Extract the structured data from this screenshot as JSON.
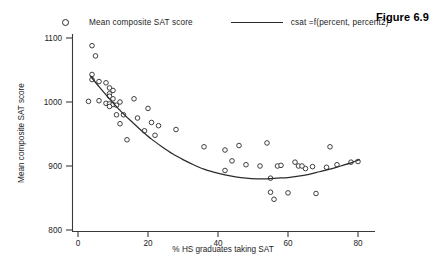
{
  "figure": {
    "caption": "Figure 6.9"
  },
  "legend": {
    "position": "top",
    "entries": [
      {
        "label": "Mean composite SAT score",
        "symbol": "open-circle-marker"
      },
      {
        "label": "csat =f(percent, percent2)",
        "symbol": "solid-line"
      }
    ]
  },
  "chart_data": {
    "type": "scatter",
    "title": "",
    "xlabel": "% HS graduates taking SAT",
    "ylabel": "Mean composite SAT score",
    "xlim": [
      0,
      85
    ],
    "ylim": [
      790,
      1130
    ],
    "xticks": [
      0,
      20,
      40,
      60,
      80
    ],
    "yticks": [
      800,
      900,
      1000,
      1100
    ],
    "grid": false,
    "legend_position": "top",
    "series": [
      {
        "name": "Mean composite SAT score",
        "type": "scatter",
        "marker": "open-circle",
        "points": [
          [
            4,
            1088
          ],
          [
            5,
            1072
          ],
          [
            4,
            1043
          ],
          [
            4,
            1035
          ],
          [
            6,
            1032
          ],
          [
            8,
            1030
          ],
          [
            9,
            1022
          ],
          [
            10,
            1018
          ],
          [
            9,
            1013
          ],
          [
            9,
            1009
          ],
          [
            10,
            1005
          ],
          [
            3,
            1001
          ],
          [
            6,
            1002
          ],
          [
            8,
            998
          ],
          [
            9,
            997
          ],
          [
            10,
            996
          ],
          [
            11,
            995
          ],
          [
            9,
            993
          ],
          [
            12,
            1000
          ],
          [
            16,
            1005
          ],
          [
            11,
            980
          ],
          [
            13,
            980
          ],
          [
            20,
            990
          ],
          [
            12,
            966
          ],
          [
            17,
            975
          ],
          [
            21,
            968
          ],
          [
            23,
            963
          ],
          [
            14,
            941
          ],
          [
            19,
            955
          ],
          [
            28,
            957
          ],
          [
            22,
            948
          ],
          [
            36,
            930
          ],
          [
            42,
            925
          ],
          [
            46,
            932
          ],
          [
            54,
            936
          ],
          [
            44,
            908
          ],
          [
            48,
            902
          ],
          [
            52,
            900
          ],
          [
            42,
            893
          ],
          [
            57,
            900
          ],
          [
            58,
            901
          ],
          [
            62,
            906
          ],
          [
            65,
            896
          ],
          [
            67,
            899
          ],
          [
            63,
            900
          ],
          [
            64,
            900
          ],
          [
            72,
            930
          ],
          [
            71,
            898
          ],
          [
            74,
            902
          ],
          [
            78,
            906
          ],
          [
            80,
            907
          ],
          [
            55,
            881
          ],
          [
            55,
            859
          ],
          [
            56,
            848
          ],
          [
            60,
            858
          ],
          [
            68,
            857
          ]
        ]
      },
      {
        "name": "csat =f(percent, percent2)",
        "type": "line",
        "fit": "quadratic",
        "points": [
          [
            3.5,
            1041
          ],
          [
            6,
            1024
          ],
          [
            9,
            1005
          ],
          [
            12,
            987
          ],
          [
            15,
            971
          ],
          [
            18,
            956
          ],
          [
            21,
            942
          ],
          [
            24,
            930
          ],
          [
            27,
            919
          ],
          [
            30,
            910
          ],
          [
            33,
            902
          ],
          [
            36,
            895
          ],
          [
            39,
            890
          ],
          [
            42,
            886
          ],
          [
            45,
            883
          ],
          [
            48,
            881
          ],
          [
            51,
            880
          ],
          [
            54,
            880
          ],
          [
            57,
            881
          ],
          [
            60,
            882
          ],
          [
            63,
            884
          ],
          [
            66,
            887
          ],
          [
            69,
            891
          ],
          [
            72,
            895
          ],
          [
            75,
            900
          ],
          [
            78,
            905
          ],
          [
            80.5,
            910
          ]
        ]
      }
    ]
  }
}
